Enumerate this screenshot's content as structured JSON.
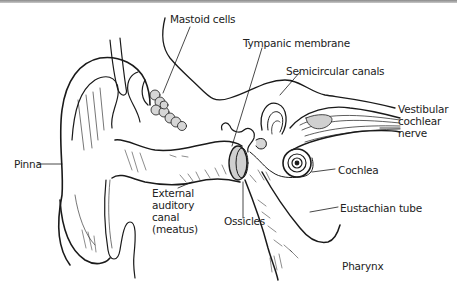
{
  "diagram": {
    "colors": {
      "line": "#1a1a1a",
      "shade": "#cfcfcf",
      "top_band": "#9a9a9a",
      "background": "#ffffff"
    },
    "labels": {
      "mastoid_cells": "Mastoid cells",
      "tympanic_membrane": "Tympanic membrane",
      "semicircular_canals": "Semicircular canals",
      "vestibular_cochlear_nerve": [
        "Vestibular",
        "cochlear",
        "nerve"
      ],
      "pinna": "Pinna",
      "cochlea": "Cochlea",
      "external_auditory_canal": [
        "External",
        "auditory",
        "canal",
        "(meatus)"
      ],
      "ossicles": "Ossicles",
      "eustachian_tube": "Eustachian tube",
      "pharynx": "Pharynx"
    }
  }
}
